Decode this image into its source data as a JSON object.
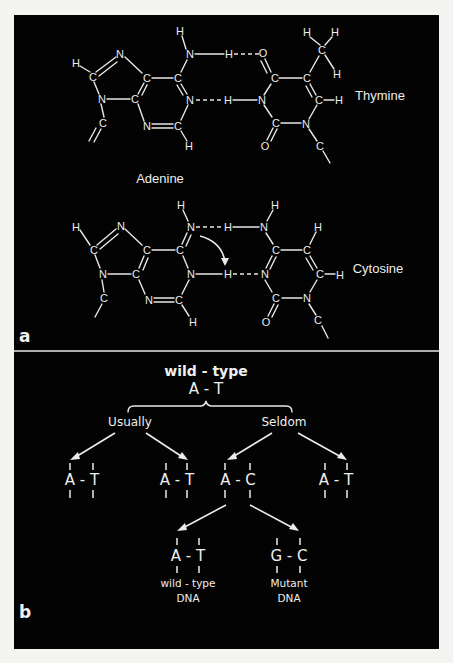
{
  "figure": {
    "panel_a": {
      "label": "a",
      "top_pair": {
        "left_base": "Adenine",
        "right_base": "Thymine"
      },
      "bottom_pair": {
        "right_base": "Cytosine"
      },
      "adenine_label": "Adenine",
      "atoms": {
        "H": "H",
        "C": "C",
        "N": "N",
        "O": "O"
      }
    },
    "panel_b": {
      "label": "b",
      "root": {
        "title": "wild - type",
        "pair": "A - T"
      },
      "branches": [
        {
          "label": "Usually",
          "children": [
            "A - T",
            "A - T"
          ]
        },
        {
          "label": "Seldom",
          "children": [
            "A - C",
            "A - T"
          ]
        }
      ],
      "mispair": "A - C",
      "outcomes": [
        {
          "pair": "A - T",
          "label_line1": "wild - type",
          "label_line2": "DNA"
        },
        {
          "pair": "G - C",
          "label_line1": "Mutant",
          "label_line2": "DNA"
        }
      ]
    },
    "colors": {
      "background": "#030303",
      "foreground": "#ededed",
      "page": "#f4f4f2"
    }
  }
}
